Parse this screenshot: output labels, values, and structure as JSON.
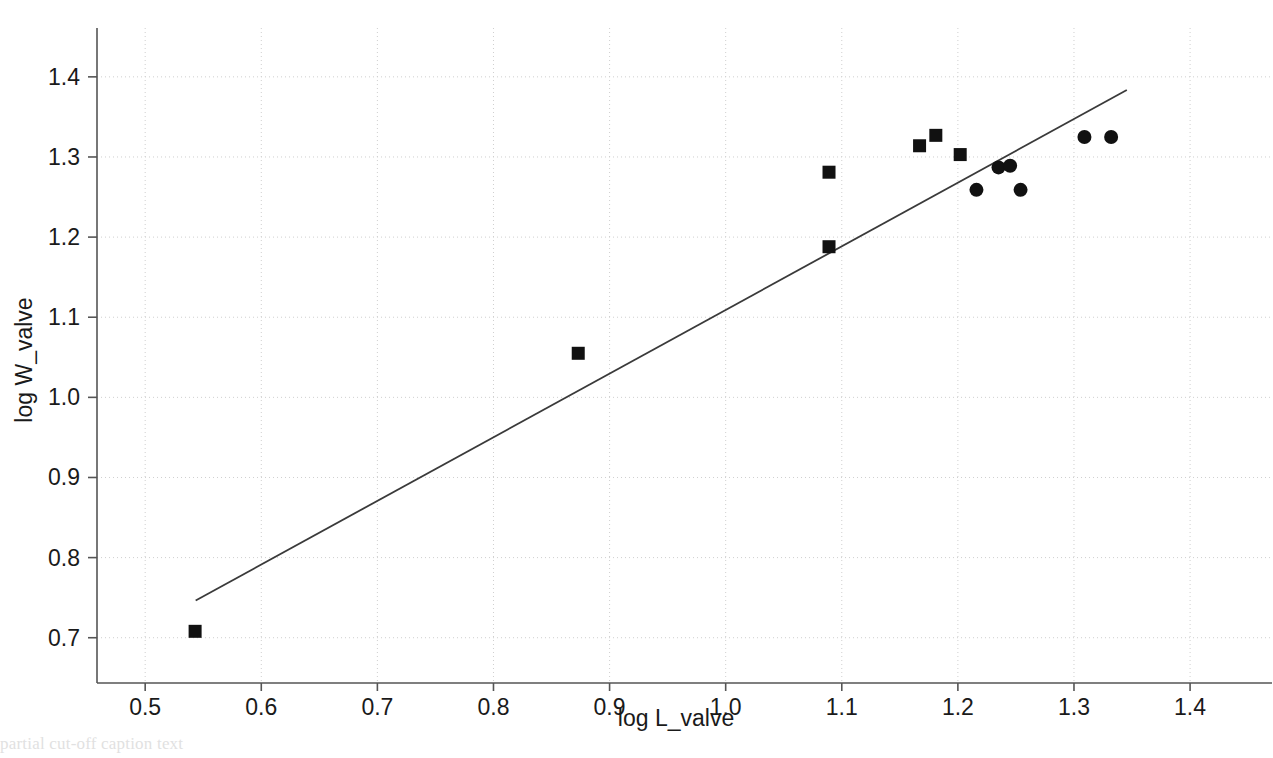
{
  "figure": {
    "background_color": "#ffffff",
    "marker_color": "#111111",
    "line_color": "#3a3a3a",
    "grid_color": "#cfcfcf",
    "axis_color": "#555555",
    "caption_fragment": "partial cut-off caption text"
  },
  "chart_data": {
    "type": "scatter",
    "title": "",
    "xlabel": "log L_valve",
    "ylabel": "log W_valve",
    "xlim": [
      0.4585,
      1.4585
    ],
    "ylim": [
      0.6435,
      1.4435
    ],
    "xticks": [
      "0.5",
      "0.6",
      "0.7",
      "0.8",
      "0.9",
      "1.0",
      "1.1",
      "1.2",
      "1.3",
      "1.4"
    ],
    "xtick_values": [
      0.5,
      0.6,
      0.7,
      0.8,
      0.9,
      1.0,
      1.1,
      1.2,
      1.3,
      1.4
    ],
    "yticks": [
      "0.7",
      "0.8",
      "0.9",
      "1.0",
      "1.1",
      "1.2",
      "1.3",
      "1.4"
    ],
    "ytick_values": [
      0.7,
      0.8,
      0.9,
      1.0,
      1.1,
      1.2,
      1.3,
      1.4
    ],
    "grid": true,
    "grid_style": "dotted",
    "legend": false,
    "legend_position": "none",
    "series": [
      {
        "name": "square-markers",
        "marker": "square",
        "color": "#111111",
        "points": [
          {
            "x": 0.543,
            "y": 0.708
          },
          {
            "x": 0.873,
            "y": 1.055
          },
          {
            "x": 1.089,
            "y": 1.188
          },
          {
            "x": 1.089,
            "y": 1.281
          },
          {
            "x": 1.167,
            "y": 1.314
          },
          {
            "x": 1.181,
            "y": 1.327
          },
          {
            "x": 1.202,
            "y": 1.303
          }
        ]
      },
      {
        "name": "circle-markers",
        "marker": "circle",
        "color": "#111111",
        "points": [
          {
            "x": 1.216,
            "y": 1.259
          },
          {
            "x": 1.235,
            "y": 1.287
          },
          {
            "x": 1.245,
            "y": 1.289
          },
          {
            "x": 1.254,
            "y": 1.259
          },
          {
            "x": 1.309,
            "y": 1.325
          },
          {
            "x": 1.332,
            "y": 1.325
          }
        ]
      }
    ],
    "fit_line": {
      "name": "regression-line",
      "color": "#3a3a3a",
      "x_start": 0.5435,
      "y_start": 0.7465,
      "x_end": 1.3455,
      "y_end": 1.3835,
      "slope": 0.794,
      "intercept": 0.315
    }
  }
}
